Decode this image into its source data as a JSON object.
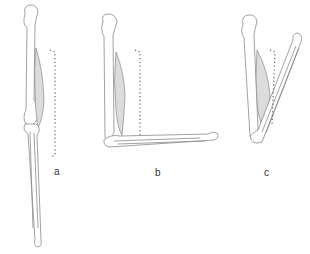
{
  "figure": {
    "panels": [
      {
        "id": "a",
        "label": "a",
        "state": "extended"
      },
      {
        "id": "b",
        "label": "b",
        "state": "flexed 90 degrees"
      },
      {
        "id": "c",
        "label": "c",
        "state": "fully flexed"
      }
    ]
  },
  "colors": {
    "bone_stroke": "#8a8a8a",
    "muscle_fill": "#dcdcdc",
    "dotted_line": "#555555",
    "background": "#ffffff"
  }
}
